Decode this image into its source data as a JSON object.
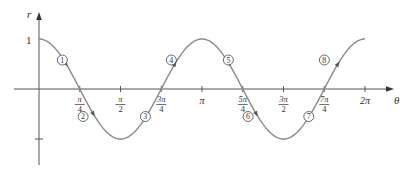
{
  "chart_data": {
    "type": "line",
    "title": "",
    "function": "r = cos(2θ)",
    "xlabel": "θ",
    "ylabel": "r",
    "xlim": [
      0,
      6.2832
    ],
    "ylim": [
      -1,
      1
    ],
    "grid": false,
    "legend": null,
    "y_tick_labels": [
      {
        "value": 1,
        "label": "1"
      },
      {
        "value": -1,
        "label": ""
      }
    ],
    "x_ticks": [
      {
        "value": 0.7854,
        "num": "π",
        "den": "4",
        "label": "π/4"
      },
      {
        "value": 1.5708,
        "num": "π",
        "den": "2",
        "label": "π/2"
      },
      {
        "value": 2.3562,
        "num": "3π",
        "den": "4",
        "label": "3π/4"
      },
      {
        "value": 3.1416,
        "num": "π",
        "den": "",
        "label": "π"
      },
      {
        "value": 3.927,
        "num": "5π",
        "den": "4",
        "label": "5π/4"
      },
      {
        "value": 4.7124,
        "num": "3π",
        "den": "2",
        "label": "3π/2"
      },
      {
        "value": 5.4978,
        "num": "7π",
        "den": "4",
        "label": "7π/4"
      },
      {
        "value": 6.2832,
        "num": "2π",
        "den": "",
        "label": "2π"
      }
    ],
    "series": [
      {
        "name": "cos 2θ",
        "x": [
          0,
          0.3927,
          0.7854,
          1.1781,
          1.5708,
          1.9635,
          2.3562,
          2.7489,
          3.1416,
          3.5343,
          3.927,
          4.3197,
          4.7124,
          5.1051,
          5.4978,
          5.8905,
          6.2832
        ],
        "values": [
          1,
          0.707,
          0,
          -0.707,
          -1,
          -0.707,
          0,
          0.707,
          1,
          0.707,
          0,
          -0.707,
          -1,
          -0.707,
          0,
          0.707,
          1
        ]
      }
    ],
    "annotations": [
      {
        "label": "1",
        "x": 0.45,
        "y": 0.58,
        "arrow_at": 0.5236
      },
      {
        "label": "2",
        "x": 0.85,
        "y": -0.55,
        "arrow_at": 1.0472
      },
      {
        "label": "3",
        "x": 2.05,
        "y": -0.55,
        "arrow_at": 2.0944
      },
      {
        "label": "4",
        "x": 2.55,
        "y": 0.58,
        "arrow_at": 2.618
      },
      {
        "label": "5",
        "x": 3.65,
        "y": 0.58,
        "arrow_at": 3.6652
      },
      {
        "label": "6",
        "x": 4.03,
        "y": -0.55,
        "arrow_at": 4.1888
      },
      {
        "label": "7",
        "x": 5.2,
        "y": -0.55,
        "arrow_at": 5.236
      },
      {
        "label": "8",
        "x": 5.5,
        "y": 0.58,
        "arrow_at": 5.7596
      }
    ]
  },
  "axes": {
    "y_label": "r",
    "x_label": "θ",
    "y_one_label": "1"
  }
}
